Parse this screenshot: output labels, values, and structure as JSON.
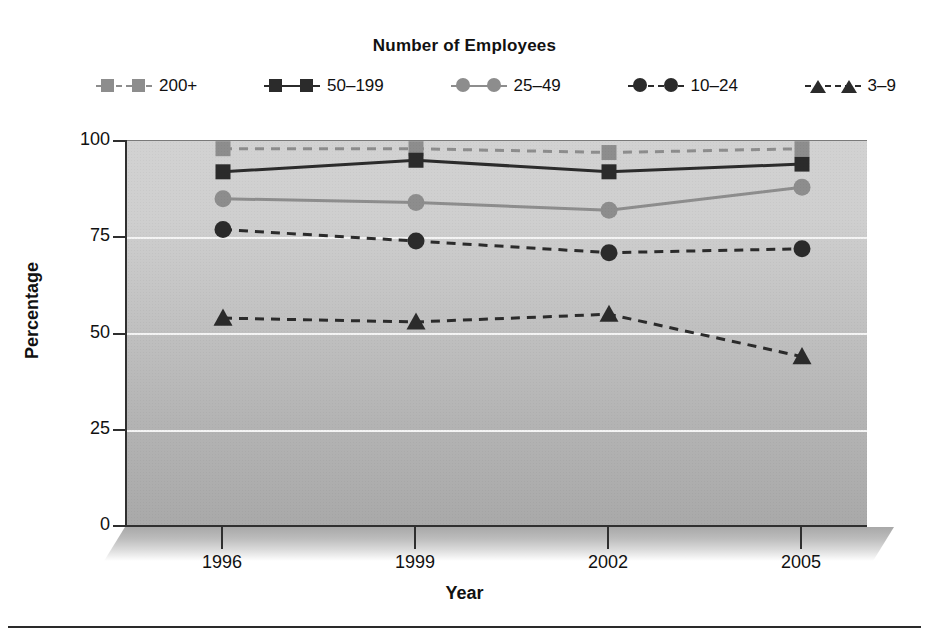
{
  "chart_data": {
    "type": "line",
    "title": "",
    "legend_title": "Number of Employees",
    "legend_position": "top",
    "xlabel": "Year",
    "ylabel": "Percentage",
    "categories": [
      "1996",
      "1999",
      "2002",
      "2005"
    ],
    "x": [
      1996,
      1999,
      2002,
      2005
    ],
    "ylim": [
      0,
      100
    ],
    "yticks": [
      0,
      25,
      50,
      75,
      100
    ],
    "grid": true,
    "grid_axis": "y",
    "series": [
      {
        "name": "200+",
        "values": [
          98,
          98,
          97,
          98
        ],
        "color": "#8d8d8d",
        "line_style": "dashed",
        "marker": "square"
      },
      {
        "name": "50–199",
        "values": [
          92,
          95,
          92,
          94
        ],
        "color": "#2b2b2b",
        "line_style": "solid",
        "marker": "square"
      },
      {
        "name": "25–49",
        "values": [
          85,
          84,
          82,
          88
        ],
        "color": "#8d8d8d",
        "line_style": "solid",
        "marker": "circle"
      },
      {
        "name": "10–24",
        "values": [
          77,
          74,
          71,
          72
        ],
        "color": "#2b2b2b",
        "line_style": "dashed",
        "marker": "circle"
      },
      {
        "name": "3–9",
        "values": [
          54,
          53,
          55,
          44
        ],
        "color": "#2b2b2b",
        "line_style": "dashed",
        "marker": "triangle"
      }
    ]
  },
  "axes": {
    "y_tick_labels": [
      "100",
      "75",
      "50",
      "25",
      "0"
    ],
    "x_tick_labels": [
      "1996",
      "1999",
      "2002",
      "2005"
    ],
    "y_axis_title": "Percentage",
    "x_axis_title": "Year"
  },
  "legend": {
    "title": "Number of Employees",
    "items": [
      {
        "label": "200+"
      },
      {
        "label": "50–199"
      },
      {
        "label": "25–49"
      },
      {
        "label": "10–24"
      },
      {
        "label": "3–9"
      }
    ]
  },
  "colors": {
    "dark": "#2b2b2b",
    "gray": "#8d8d8d",
    "gridline": "#f4f4f4",
    "plot_bg_top": "#d2d2d2",
    "plot_bg_bottom": "#a9a9a9"
  }
}
